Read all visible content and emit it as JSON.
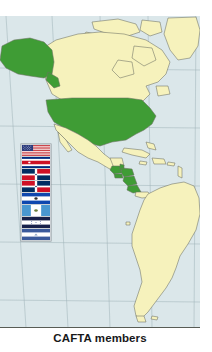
{
  "caption": "CAFTA members",
  "colors": {
    "ocean": "#dbe7ea",
    "land": "#f6f2bc",
    "member_highlight": "#3f9c35",
    "border": "#6d6f63",
    "graticule": "#9fb3b8",
    "caption_text": "#17181a"
  },
  "map": {
    "region_label": "The Americas",
    "legend_meaning": "Green shading indicates CAFTA-DR member countries",
    "member_countries": [
      "United States",
      "Costa Rica",
      "Dominican Republic",
      "El Salvador",
      "Guatemala",
      "Honduras",
      "Nicaragua"
    ]
  },
  "flag_strip": {
    "name": "cafta-member-flags",
    "flags": [
      {
        "country": "United States",
        "icon": "flag-united-states"
      },
      {
        "country": "Costa Rica",
        "icon": "flag-costa-rica"
      },
      {
        "country": "Dominican Republic",
        "icon": "flag-dominican-republic"
      },
      {
        "country": "Dominican Republic",
        "icon": "flag-dominican-republic"
      },
      {
        "country": "El Salvador",
        "icon": "flag-el-salvador"
      },
      {
        "country": "Guatemala",
        "icon": "flag-guatemala"
      },
      {
        "country": "Honduras",
        "icon": "flag-honduras"
      },
      {
        "country": "Nicaragua",
        "icon": "flag-nicaragua"
      }
    ]
  }
}
